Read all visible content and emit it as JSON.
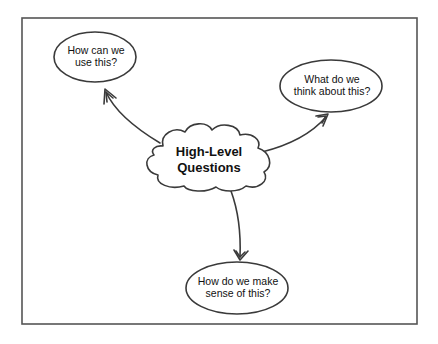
{
  "diagram": {
    "type": "concept-map",
    "colors": {
      "stroke": "#3a3a3a",
      "frame": "#555555",
      "fill": "#ffffff",
      "text": "#111111"
    },
    "center": {
      "shape": "cloud",
      "line1": "High-Level",
      "line2": "Questions"
    },
    "nodes": [
      {
        "id": "use",
        "shape": "ellipse",
        "line1": "How can we",
        "line2": "use this?"
      },
      {
        "id": "think",
        "shape": "ellipse",
        "line1": "What do we",
        "line2": "think about this?"
      },
      {
        "id": "sense",
        "shape": "ellipse",
        "line1": "How do we make",
        "line2": "sense of this?"
      }
    ],
    "edges": [
      {
        "from": "center",
        "to": "use"
      },
      {
        "from": "center",
        "to": "think"
      },
      {
        "from": "center",
        "to": "sense"
      }
    ]
  }
}
